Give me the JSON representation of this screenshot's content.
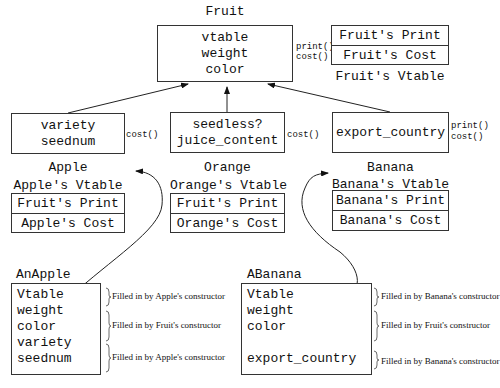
{
  "fruit": {
    "title": "Fruit",
    "fields": [
      "vtable",
      "weight",
      "color"
    ],
    "methods": [
      "print()",
      "cost()"
    ],
    "vtable": {
      "title": "Fruit's Vtable",
      "rows": [
        "Fruit's Print",
        "Fruit's Cost"
      ]
    }
  },
  "apple": {
    "title": "Apple",
    "fields": [
      "variety",
      "seednum"
    ],
    "methods": [
      "cost()"
    ],
    "vtable": {
      "title": "Apple's Vtable",
      "rows": [
        "Fruit's Print",
        "Apple's Cost"
      ]
    }
  },
  "orange": {
    "title": "Orange",
    "fields": [
      "seedless?",
      "juice_content"
    ],
    "methods": [
      "cost()"
    ],
    "vtable": {
      "title": "Orange's Vtable",
      "rows": [
        "Fruit's Print",
        "Orange's Cost"
      ]
    }
  },
  "banana": {
    "title": "Banana",
    "fields": [
      "export_country"
    ],
    "methods": [
      "print()",
      "cost()"
    ],
    "vtable": {
      "title": "Banana's Vtable",
      "rows": [
        "Banana's Print",
        "Banana's Cost"
      ]
    }
  },
  "an_apple": {
    "title": "AnApple",
    "fields": [
      "Vtable",
      "weight",
      "color",
      "variety",
      "seednum"
    ],
    "notes": [
      "Filled in by Apple's constructor",
      "Filled in by Fruit's constructor",
      "Filled in by Apple's constructor"
    ]
  },
  "a_banana": {
    "title": "ABanana",
    "fields": [
      "Vtable",
      "weight",
      "color",
      "export_country"
    ],
    "notes": [
      "Filled in by Banana's constructor",
      "Filled in by Fruit's constructor",
      "Filled in by Banana's constructor"
    ]
  }
}
